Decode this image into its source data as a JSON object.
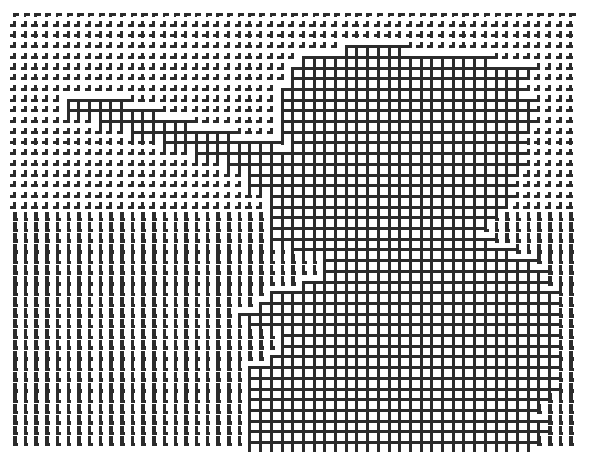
{
  "image": {
    "description": "Halftone grid pattern: a lattice of small cross/L-shaped marks where darker areas become a fully connected square mesh",
    "width": 591,
    "height": 464,
    "ink_color": "#2b2b2b",
    "paper_color": "#ffffff"
  },
  "grid": {
    "origin_x": 13,
    "origin_y": 13,
    "pitch": 10.7,
    "cols": 53,
    "rows": 41,
    "line_width": 3,
    "mask": [
      ".....................................................",
      ".....................................................",
      ".....................................................",
      "...............................######................",
      "...........................##################.........",
      "..........................#######################....",
      "..........................######################.....",
      ".........................#######################.....",
      ".....######..............########################....",
      ".....#########...........########################....",
      "........#########........########################....",
      "...........##########....#######################.....",
      "..............###########.######################.....",
      ".................###############################.....",
      "....................############################.....",
      "......................#########################......",
      "......................#########################......",
      "........................#######################......",
      "........................######################.......",
      "........................#####################........",
      "........................####################.........",
      "........................#####################........",
      "..........................#####################......",
      ".............................####################....",
      ".............................#####################...",
      "...........................#######################...",
      "........................###########################..",
      ".......................############################..",
      ".....................##############################..",
      "......................#############################..",
      ".........................##########################..",
      ".........................##########################..",
      "........................###########################..",
      "......................#############################..",
      "......................#############################..",
      "......................#############################..",
      "......................############################...",
      "......................###########################....",
      "......................############################...",
      "......................############################...",
      "......................###########################...."
    ]
  }
}
